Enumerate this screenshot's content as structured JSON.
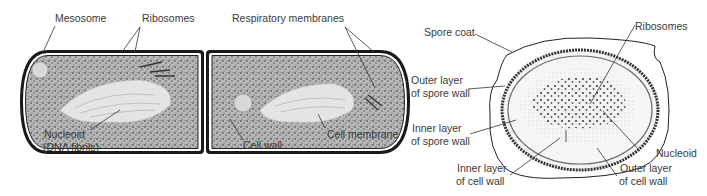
{
  "figure": {
    "left_panel": {
      "subject": "vegetative-bacterial-cells",
      "labels": {
        "mesosome": "Mesosome",
        "ribosomes": "Ribosomes",
        "respiratory_membranes": "Respiratory membranes",
        "nucleoid_line1": "Nucleoid",
        "nucleoid_line2": "(DNA fibrils)",
        "cell_wall": "Cell wall",
        "cell_membrane": "Cell membrane"
      }
    },
    "right_panel": {
      "subject": "bacterial-endospore",
      "labels": {
        "spore_coat": "Spore coat",
        "ribosomes": "Ribosomes",
        "outer_spore_wall_line1": "Outer layer",
        "outer_spore_wall_line2": "of spore wall",
        "inner_spore_wall_line1": "Inner layer",
        "inner_spore_wall_line2": "of spore wall",
        "nucleoid": "Nucleoid",
        "inner_cell_wall_line1": "Inner layer",
        "inner_cell_wall_line2": "of cell wall",
        "outer_cell_wall_line1": "Outer layer",
        "outer_cell_wall_line2": "of cell wall"
      }
    },
    "colors": {
      "ink": "#1a1a1a",
      "label": "#3a3a3a",
      "cytoplasm": "#9a9a9a",
      "nucleoid": "#e6e6e6",
      "spore_core": "#efefef"
    }
  }
}
